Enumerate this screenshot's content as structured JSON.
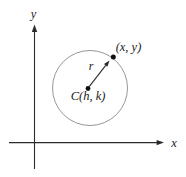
{
  "diagram": {
    "labels": {
      "x_axis": "x",
      "y_axis": "y",
      "point": "(x, y)",
      "radius": "r",
      "center": "C(h, k)"
    },
    "colors": {
      "axis": "#2b2b2b",
      "circle": "#979797",
      "dot": "#111111",
      "text": "#1a1a1a",
      "background": "#ffffff"
    }
  }
}
